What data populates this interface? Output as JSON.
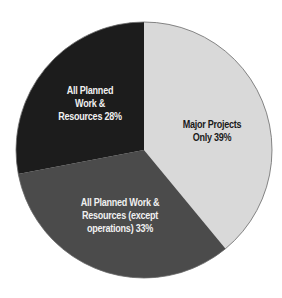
{
  "chart_data": {
    "type": "pie",
    "title": "",
    "start_angle_deg": 0,
    "direction": "clockwise",
    "slices": [
      {
        "label": "Major Projects Only",
        "value": 39,
        "display": [
          "Major Projects",
          "Only 39%"
        ],
        "color": "#d9d9d9",
        "text_color": "#1a1a1a"
      },
      {
        "label": "All Planned Work & Resources (except operations)",
        "value": 33,
        "display": [
          "All Planned Work &",
          "Resources (except",
          "operations) 33%"
        ],
        "color": "#4b4b4b",
        "text_color": "#f0f0f0"
      },
      {
        "label": "All Planned Work & Resources",
        "value": 28,
        "display": [
          "All Planned",
          "Work &",
          "Resources 28%"
        ],
        "color": "#1c1c1c",
        "text_color": "#f0f0f0"
      }
    ],
    "legend": "none",
    "grid": false
  }
}
